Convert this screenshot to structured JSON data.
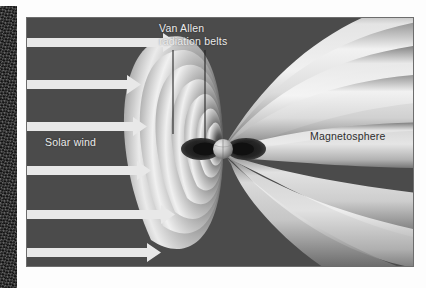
{
  "figure": {
    "background_color": "#4b4b4b",
    "border_color": "#6d6d6d",
    "caption_sliver": "",
    "labels": {
      "van_allen": "Van Allen\nradiation belts",
      "solar_wind": "Solar wind",
      "magnetosphere": "Magnetosphere"
    },
    "label_colors": {
      "light_text": "#ebebeb",
      "dark_text": "#2e2e2e"
    },
    "solar_wind": {
      "arrow_color": "#e8e8e8",
      "arrow_count": 6,
      "direction": "left-to-right",
      "arrows": [
        {
          "y": 24,
          "length": 148
        },
        {
          "y": 66,
          "length": 112
        },
        {
          "y": 108,
          "length": 118
        },
        {
          "y": 152,
          "length": 122
        },
        {
          "y": 196,
          "length": 146
        },
        {
          "y": 234,
          "length": 132
        }
      ]
    },
    "earth": {
      "cx": 196,
      "cy": 131,
      "r": 10,
      "light_color": "#d8d8d8",
      "dark_color": "#5c5c5c"
    },
    "radiation_belts": {
      "color": "#1b1b1b",
      "count": 2,
      "side": "both flanks of Earth"
    },
    "leader_lines": {
      "color": "#2b2b2b",
      "count": 2,
      "from": "Van Allen radiation belts label",
      "to": "inner belt lobes"
    },
    "field_lobes": {
      "dayside_count": 7,
      "tail_count": 5,
      "light_color": "#f2f2f2",
      "mid_color": "#b9b9b9",
      "shadow_color": "#6e6e6e"
    }
  }
}
